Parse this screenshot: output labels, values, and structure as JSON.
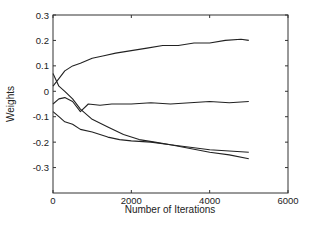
{
  "chart_data": {
    "type": "line",
    "title": "",
    "xlabel": "Number of Iterations",
    "ylabel": "Weights",
    "xlim": [
      0,
      6000
    ],
    "ylim": [
      -0.4,
      0.3
    ],
    "xticks": [
      0,
      2000,
      4000,
      6000
    ],
    "xtick_labels": [
      "0",
      "2000",
      "4000",
      "6000"
    ],
    "yticks": [
      0.3,
      0.2,
      0.1,
      0,
      -0.1,
      -0.2,
      -0.3
    ],
    "ytick_labels": [
      "0.3",
      "0.2",
      "0.1",
      "0",
      "-0.1",
      "-0.2",
      "-0.3"
    ],
    "grid": false,
    "legend": null,
    "line_color": "#222222",
    "series": [
      {
        "name": "weight-1",
        "x": [
          0,
          150,
          300,
          500,
          700,
          1000,
          1300,
          1600,
          2000,
          2400,
          2800,
          3200,
          3600,
          4000,
          4400,
          4800,
          5000
        ],
        "y": [
          0.02,
          0.05,
          0.08,
          0.1,
          0.11,
          0.13,
          0.14,
          0.15,
          0.16,
          0.17,
          0.18,
          0.18,
          0.19,
          0.19,
          0.2,
          0.205,
          0.2
        ]
      },
      {
        "name": "weight-2",
        "x": [
          0,
          150,
          300,
          500,
          700,
          900,
          1200,
          1500,
          2000,
          2500,
          3000,
          3500,
          4000,
          4500,
          5000
        ],
        "y": [
          -0.05,
          -0.03,
          -0.025,
          -0.04,
          -0.08,
          -0.05,
          -0.055,
          -0.05,
          -0.05,
          -0.045,
          -0.05,
          -0.045,
          -0.04,
          -0.045,
          -0.04
        ]
      },
      {
        "name": "weight-3",
        "x": [
          0,
          150,
          300,
          500,
          700,
          1000,
          1400,
          1800,
          2200,
          2600,
          3000,
          3500,
          4000,
          4500,
          5000
        ],
        "y": [
          0.07,
          0.02,
          0.0,
          -0.03,
          -0.07,
          -0.11,
          -0.14,
          -0.17,
          -0.19,
          -0.2,
          -0.21,
          -0.22,
          -0.23,
          -0.235,
          -0.24
        ]
      },
      {
        "name": "weight-4",
        "x": [
          0,
          150,
          300,
          500,
          700,
          1000,
          1400,
          1700,
          2000,
          2500,
          3000,
          3500,
          4000,
          4500,
          5000
        ],
        "y": [
          -0.08,
          -0.1,
          -0.12,
          -0.13,
          -0.15,
          -0.16,
          -0.18,
          -0.19,
          -0.195,
          -0.2,
          -0.21,
          -0.225,
          -0.24,
          -0.25,
          -0.265
        ]
      }
    ]
  }
}
